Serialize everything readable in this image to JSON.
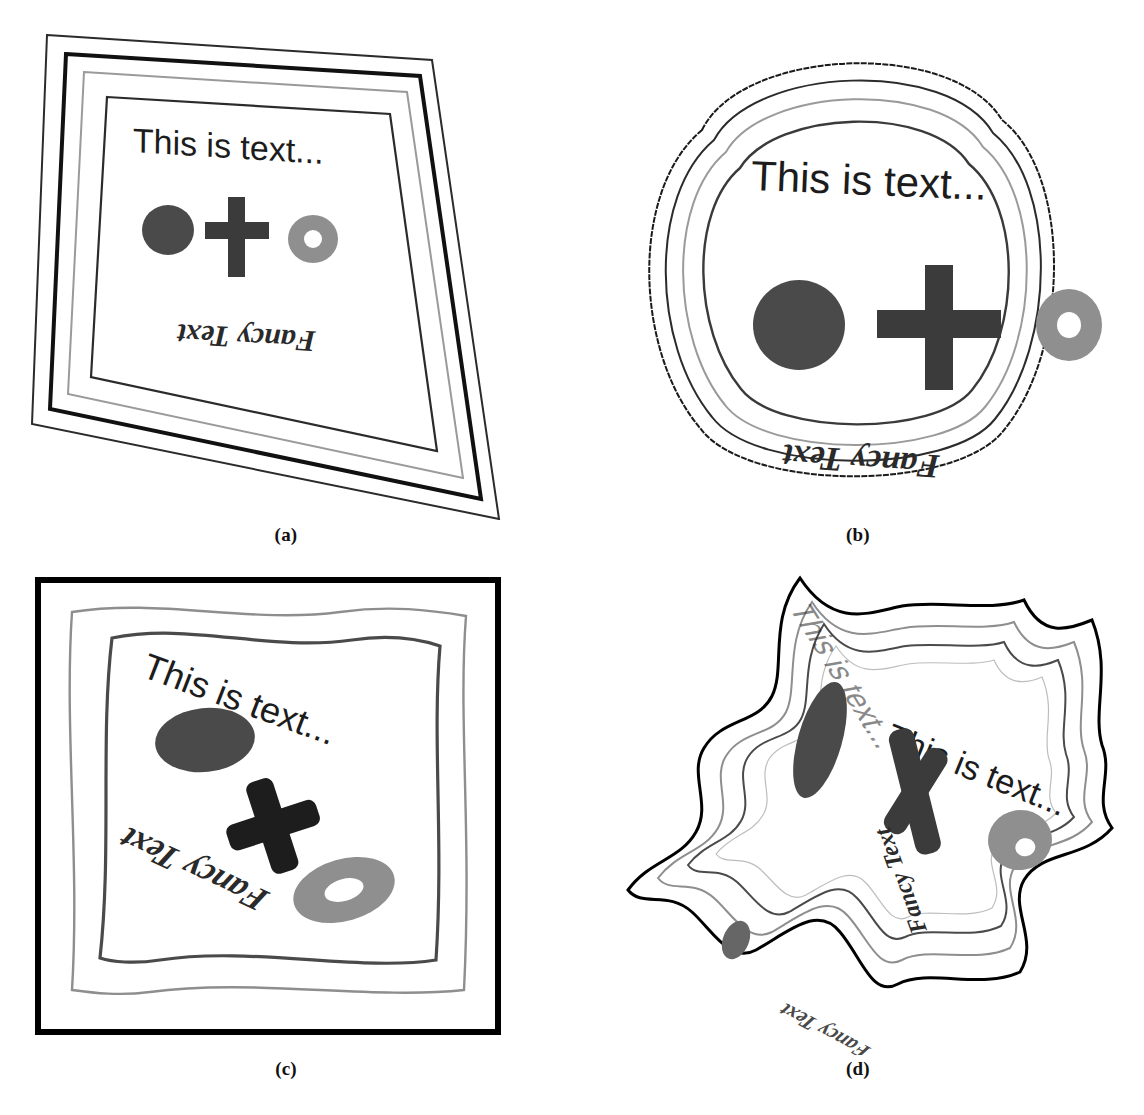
{
  "figure": {
    "background_color": "#ffffff",
    "panels": [
      {
        "id": "a",
        "caption": "(a)",
        "warp_name": "perspective",
        "content": {
          "heading_text": "This is text...",
          "footer_text": "Fancy Text",
          "footer_rotation_deg": 180,
          "shapes": [
            "filled-circle",
            "plus-cross",
            "ring-donut"
          ]
        },
        "frames": [
          {
            "name": "outer-frame",
            "stroke": "#2b2b2b",
            "width": 2.0
          },
          {
            "name": "bold-frame",
            "stroke": "#111111",
            "width": 4.0
          },
          {
            "name": "gray-frame",
            "stroke": "#9a9a9a",
            "width": 2.0
          },
          {
            "name": "inner-frame",
            "stroke": "#2b2b2b",
            "width": 2.2
          }
        ]
      },
      {
        "id": "b",
        "caption": "(b)",
        "warp_name": "barrel",
        "content": {
          "heading_text": "This is text...",
          "footer_text": "Fancy Text",
          "footer_rotation_deg": 180,
          "shapes": [
            "filled-circle",
            "plus-cross",
            "ring-donut"
          ]
        },
        "frames": [
          {
            "name": "outer-frame",
            "stroke": "#1a1a1a",
            "width": 2.0
          },
          {
            "name": "bold-frame",
            "stroke": "#2b2b2b",
            "width": 2.0
          },
          {
            "name": "gray-frame",
            "stroke": "#9a9a9a",
            "width": 2.0
          },
          {
            "name": "inner-frame",
            "stroke": "#3a3a3a",
            "width": 2.4
          }
        ]
      },
      {
        "id": "c",
        "caption": "(c)",
        "warp_name": "wave",
        "content": {
          "heading_text": "This is text...",
          "footer_text": "Fancy Text",
          "footer_rotation_deg": 180,
          "shapes": [
            "filled-circle",
            "plus-cross",
            "ring-donut"
          ]
        },
        "frames": [
          {
            "name": "outer-frame",
            "stroke": "#000000",
            "width": 6.0
          },
          {
            "name": "gray-frame",
            "stroke": "#8e8e8e",
            "width": 2.4
          },
          {
            "name": "inner-frame",
            "stroke": "#4a4a4a",
            "width": 3.2
          }
        ]
      },
      {
        "id": "d",
        "caption": "(d)",
        "warp_name": "extreme-nonlinear",
        "content": {
          "heading_text": "This is text...",
          "footer_text": "Fancy Text",
          "footer_rotation_deg": 180,
          "shapes": [
            "filled-circle",
            "plus-cross",
            "ring-donut"
          ]
        },
        "frames": [
          {
            "name": "outer-frame",
            "stroke": "#000000",
            "width": 3.0
          },
          {
            "name": "gray-frame",
            "stroke": "#8e8e8e",
            "width": 2.0
          },
          {
            "name": "inner-frame",
            "stroke": "#4a4a4a",
            "width": 2.0
          },
          {
            "name": "hairline-frame",
            "stroke": "#bdbdbd",
            "width": 1.2
          }
        ]
      }
    ],
    "palette": {
      "circle_fill": "#4a4a4a",
      "cross_fill": "#3b3b3b",
      "donut_fill": "#8f8f8f",
      "donut_hole": "#ffffff",
      "heading_color": "#1c1c1c",
      "footer_color": "#2a2a2a",
      "page_background": "#ffffff"
    }
  }
}
